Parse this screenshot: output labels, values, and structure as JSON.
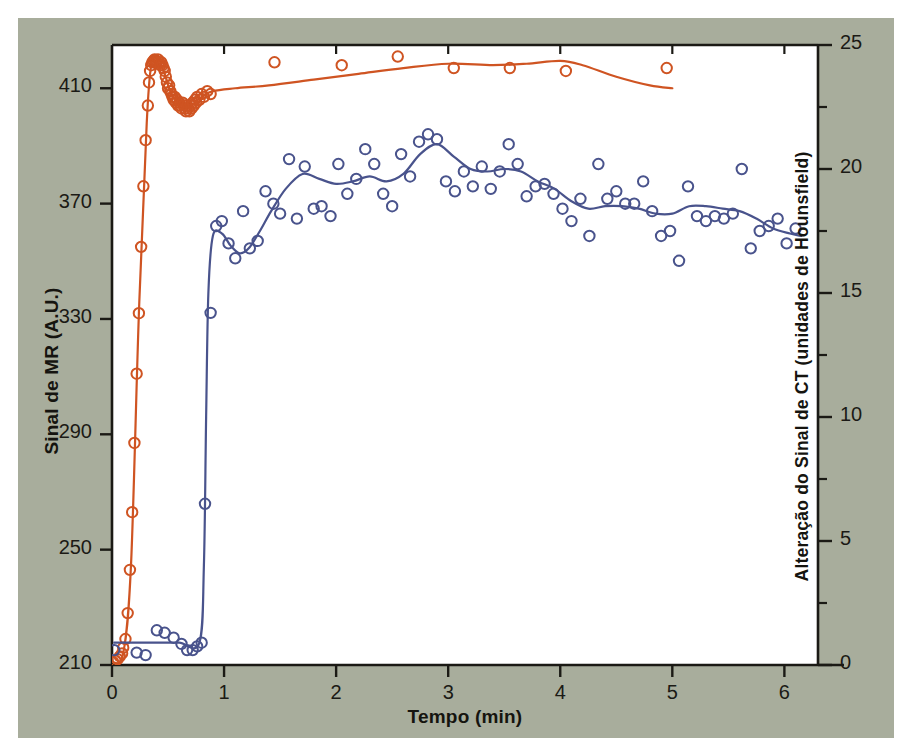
{
  "figure": {
    "panel_bg": "#a8ad9c",
    "plot_bg": "#ffffff",
    "axis_color": "#1b1a15"
  },
  "chart_data": {
    "type": "scatter",
    "title": "",
    "xlabel": "Tempo (min)",
    "ylabel": "Sinal de MR (A.U.)",
    "ylabel_right": "Alteração do Sinal de CT (unidades de Hounsfield)",
    "xlim": [
      0,
      6.3
    ],
    "ylim": [
      210,
      425
    ],
    "ylim_right": [
      0,
      25
    ],
    "xticks": [
      0,
      1,
      2,
      3,
      4,
      5,
      6
    ],
    "xticklabels": [
      "0",
      "1",
      "2",
      "3",
      "4",
      "5",
      "6"
    ],
    "yticks": [
      210,
      250,
      290,
      330,
      370,
      410
    ],
    "yticklabels": [
      "210",
      "250",
      "290",
      "330",
      "370",
      "410"
    ],
    "yticks_right": [
      0,
      5,
      10,
      15,
      20,
      25
    ],
    "yticklabels_right": [
      "0",
      "5",
      "10",
      "15",
      "20",
      "25"
    ],
    "yminor_right": [
      2.5,
      7.5,
      12.5,
      17.5,
      22.5
    ],
    "grid": false,
    "legend": "none",
    "series": [
      {
        "name": "Sinal de MR",
        "axis": "left",
        "color": "#cf5422",
        "marker": "open-circle",
        "points": [
          [
            0.01,
            211
          ],
          [
            0.03,
            211.5
          ],
          [
            0.05,
            212
          ],
          [
            0.07,
            213
          ],
          [
            0.09,
            214
          ],
          [
            0.1,
            216
          ],
          [
            0.12,
            219
          ],
          [
            0.14,
            228
          ],
          [
            0.16,
            243
          ],
          [
            0.18,
            263
          ],
          [
            0.2,
            287
          ],
          [
            0.22,
            311
          ],
          [
            0.24,
            332
          ],
          [
            0.26,
            355
          ],
          [
            0.28,
            376
          ],
          [
            0.3,
            392
          ],
          [
            0.32,
            404
          ],
          [
            0.33,
            412
          ],
          [
            0.34,
            416
          ],
          [
            0.35,
            418
          ],
          [
            0.36,
            419
          ],
          [
            0.37,
            419.5
          ],
          [
            0.38,
            420
          ],
          [
            0.39,
            419.5
          ],
          [
            0.4,
            419
          ],
          [
            0.41,
            420
          ],
          [
            0.42,
            419
          ],
          [
            0.43,
            418
          ],
          [
            0.44,
            419
          ],
          [
            0.45,
            418
          ],
          [
            0.46,
            417
          ],
          [
            0.47,
            416
          ],
          [
            0.48,
            414
          ],
          [
            0.49,
            412
          ],
          [
            0.5,
            410
          ],
          [
            0.51,
            411
          ],
          [
            0.52,
            409
          ],
          [
            0.53,
            408
          ],
          [
            0.54,
            407
          ],
          [
            0.55,
            406
          ],
          [
            0.56,
            407
          ],
          [
            0.57,
            405
          ],
          [
            0.58,
            406
          ],
          [
            0.59,
            404
          ],
          [
            0.6,
            405
          ],
          [
            0.61,
            404
          ],
          [
            0.62,
            403
          ],
          [
            0.63,
            405
          ],
          [
            0.64,
            404
          ],
          [
            0.65,
            403
          ],
          [
            0.66,
            402
          ],
          [
            0.67,
            404
          ],
          [
            0.68,
            403
          ],
          [
            0.69,
            402
          ],
          [
            0.7,
            404
          ],
          [
            0.71,
            403
          ],
          [
            0.72,
            405
          ],
          [
            0.73,
            404
          ],
          [
            0.74,
            406
          ],
          [
            0.75,
            405
          ],
          [
            0.76,
            407
          ],
          [
            0.78,
            406
          ],
          [
            0.8,
            408
          ],
          [
            0.82,
            407
          ],
          [
            0.85,
            409
          ],
          [
            0.88,
            408
          ],
          [
            1.45,
            419
          ],
          [
            2.05,
            418
          ],
          [
            2.55,
            421
          ],
          [
            3.05,
            417
          ],
          [
            3.55,
            417
          ],
          [
            4.05,
            416
          ],
          [
            4.95,
            417
          ]
        ],
        "smooth_line": [
          [
            0.0,
            211
          ],
          [
            0.1,
            214
          ],
          [
            0.17,
            245
          ],
          [
            0.24,
            332
          ],
          [
            0.31,
            398
          ],
          [
            0.35,
            418
          ],
          [
            0.4,
            419
          ],
          [
            0.46,
            416
          ],
          [
            0.52,
            409
          ],
          [
            0.6,
            405
          ],
          [
            0.7,
            404
          ],
          [
            0.8,
            407
          ],
          [
            0.9,
            409
          ],
          [
            1.1,
            410
          ],
          [
            1.4,
            411
          ],
          [
            1.8,
            413
          ],
          [
            2.2,
            415
          ],
          [
            2.6,
            417
          ],
          [
            3.0,
            418.5
          ],
          [
            3.4,
            418
          ],
          [
            3.7,
            418.5
          ],
          [
            4.0,
            419.5
          ],
          [
            4.2,
            418
          ],
          [
            4.5,
            414
          ],
          [
            4.8,
            411
          ],
          [
            5.0,
            410
          ]
        ]
      },
      {
        "name": "Alteração do Sinal de CT",
        "axis": "right",
        "color": "#49538c",
        "marker": "open-circle",
        "points": [
          [
            0.02,
            0.6
          ],
          [
            0.22,
            0.5
          ],
          [
            0.3,
            0.4
          ],
          [
            0.4,
            1.4
          ],
          [
            0.47,
            1.3
          ],
          [
            0.55,
            1.1
          ],
          [
            0.62,
            0.85
          ],
          [
            0.67,
            0.6
          ],
          [
            0.72,
            0.6
          ],
          [
            0.76,
            0.75
          ],
          [
            0.8,
            0.9
          ],
          [
            0.83,
            6.5
          ],
          [
            0.88,
            14.2
          ],
          [
            0.93,
            17.7
          ],
          [
            0.98,
            17.9
          ],
          [
            1.04,
            17.0
          ],
          [
            1.1,
            16.4
          ],
          [
            1.17,
            18.3
          ],
          [
            1.23,
            16.8
          ],
          [
            1.3,
            17.1
          ],
          [
            1.37,
            19.1
          ],
          [
            1.44,
            18.6
          ],
          [
            1.5,
            18.2
          ],
          [
            1.58,
            20.4
          ],
          [
            1.65,
            18.0
          ],
          [
            1.72,
            20.1
          ],
          [
            1.8,
            18.4
          ],
          [
            1.87,
            18.5
          ],
          [
            1.95,
            18.1
          ],
          [
            2.02,
            20.2
          ],
          [
            2.1,
            19.0
          ],
          [
            2.18,
            19.6
          ],
          [
            2.26,
            20.8
          ],
          [
            2.34,
            20.2
          ],
          [
            2.42,
            19.0
          ],
          [
            2.5,
            18.5
          ],
          [
            2.58,
            20.6
          ],
          [
            2.66,
            19.7
          ],
          [
            2.74,
            21.1
          ],
          [
            2.82,
            21.4
          ],
          [
            2.9,
            21.2
          ],
          [
            2.98,
            19.5
          ],
          [
            3.06,
            19.1
          ],
          [
            3.14,
            19.9
          ],
          [
            3.22,
            19.3
          ],
          [
            3.3,
            20.1
          ],
          [
            3.38,
            19.2
          ],
          [
            3.46,
            19.9
          ],
          [
            3.54,
            21.0
          ],
          [
            3.62,
            20.2
          ],
          [
            3.7,
            18.9
          ],
          [
            3.78,
            19.3
          ],
          [
            3.86,
            19.4
          ],
          [
            3.94,
            19.0
          ],
          [
            4.02,
            18.4
          ],
          [
            4.1,
            17.9
          ],
          [
            4.18,
            18.8
          ],
          [
            4.26,
            17.3
          ],
          [
            4.34,
            20.2
          ],
          [
            4.42,
            18.8
          ],
          [
            4.5,
            19.1
          ],
          [
            4.58,
            18.6
          ],
          [
            4.66,
            18.6
          ],
          [
            4.74,
            19.5
          ],
          [
            4.82,
            18.3
          ],
          [
            4.9,
            17.3
          ],
          [
            4.98,
            17.5
          ],
          [
            5.06,
            16.3
          ],
          [
            5.14,
            19.3
          ],
          [
            5.22,
            18.1
          ],
          [
            5.3,
            17.9
          ],
          [
            5.38,
            18.1
          ],
          [
            5.46,
            18.0
          ],
          [
            5.54,
            18.2
          ],
          [
            5.62,
            20.0
          ],
          [
            5.7,
            16.8
          ],
          [
            5.78,
            17.5
          ],
          [
            5.86,
            17.7
          ],
          [
            5.94,
            18.0
          ],
          [
            6.02,
            17.0
          ],
          [
            6.1,
            17.6
          ]
        ],
        "smooth_line": [
          [
            0.02,
            0.9
          ],
          [
            0.4,
            0.9
          ],
          [
            0.6,
            0.9
          ],
          [
            0.78,
            0.9
          ],
          [
            0.82,
            4.0
          ],
          [
            0.84,
            10.0
          ],
          [
            0.86,
            15.0
          ],
          [
            0.9,
            17.3
          ],
          [
            0.98,
            17.4
          ],
          [
            1.06,
            16.9
          ],
          [
            1.14,
            16.6
          ],
          [
            1.22,
            16.8
          ],
          [
            1.32,
            17.5
          ],
          [
            1.42,
            18.3
          ],
          [
            1.55,
            19.2
          ],
          [
            1.7,
            19.8
          ],
          [
            1.85,
            19.6
          ],
          [
            2.0,
            19.4
          ],
          [
            2.15,
            19.5
          ],
          [
            2.3,
            19.7
          ],
          [
            2.45,
            19.5
          ],
          [
            2.6,
            19.8
          ],
          [
            2.75,
            20.6
          ],
          [
            2.9,
            21.0
          ],
          [
            3.05,
            20.5
          ],
          [
            3.2,
            20.0
          ],
          [
            3.35,
            19.9
          ],
          [
            3.5,
            20.0
          ],
          [
            3.65,
            19.9
          ],
          [
            3.8,
            19.5
          ],
          [
            3.95,
            19.2
          ],
          [
            4.1,
            18.7
          ],
          [
            4.25,
            18.4
          ],
          [
            4.4,
            18.5
          ],
          [
            4.55,
            18.5
          ],
          [
            4.7,
            18.4
          ],
          [
            4.85,
            18.2
          ],
          [
            5.0,
            18.2
          ],
          [
            5.15,
            18.5
          ],
          [
            5.3,
            18.5
          ],
          [
            5.45,
            18.4
          ],
          [
            5.6,
            18.3
          ],
          [
            5.75,
            18.0
          ],
          [
            5.9,
            17.6
          ],
          [
            6.05,
            17.4
          ],
          [
            6.15,
            17.3
          ]
        ]
      }
    ]
  }
}
